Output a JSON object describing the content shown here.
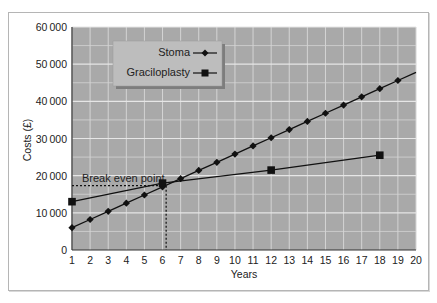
{
  "chart_data": {
    "type": "line",
    "title": "",
    "xlabel": "Years",
    "ylabel": "Costs (£)",
    "xlim": [
      1,
      20
    ],
    "ylim": [
      0,
      60000
    ],
    "x_ticks": [
      "1",
      "2",
      "3",
      "4",
      "5",
      "6",
      "7",
      "8",
      "9",
      "10",
      "11",
      "12",
      "13",
      "14",
      "15",
      "16",
      "17",
      "18",
      "19",
      "20"
    ],
    "y_ticks": [
      "0",
      "10000",
      "20000",
      "30000",
      "40000",
      "50000",
      "60000"
    ],
    "grid": true,
    "legend_position": "upper-left (inside plot)",
    "series": [
      {
        "name": "Stoma",
        "marker": "diamond",
        "x": [
          1,
          2,
          3,
          4,
          5,
          6,
          7,
          8,
          9,
          10,
          11,
          12,
          13,
          14,
          15,
          16,
          17,
          18,
          19,
          20
        ],
        "values": [
          6000,
          8200,
          10400,
          12600,
          14800,
          17000,
          19200,
          21400,
          23600,
          25800,
          28000,
          30200,
          32400,
          34600,
          36800,
          39000,
          41200,
          43400,
          45600,
          47800
        ],
        "marker_points": [
          1,
          2,
          3,
          4,
          5,
          6,
          7,
          8,
          9,
          10,
          11,
          12,
          13,
          14,
          15,
          16,
          17,
          18,
          19
        ]
      },
      {
        "name": "Graciloplasty",
        "marker": "square",
        "x": [
          1,
          6,
          12,
          18
        ],
        "values": [
          13000,
          18000,
          21500,
          25500
        ]
      }
    ],
    "annotations": [
      {
        "text": "Break even point",
        "x": 6.2,
        "y": 17300,
        "style": "dotted crosshair to axes"
      }
    ]
  },
  "legend": {
    "items": [
      {
        "label": "Stoma",
        "marker": "diamond"
      },
      {
        "label": "Graciloplasty",
        "marker": "square"
      }
    ]
  },
  "annotation_label": "Break even point",
  "colors": {
    "plot_bg": "#a9a9a9",
    "grid": "#d4d4d4",
    "line": "#111111",
    "legend_bg": "#bdbdbd",
    "legend_shadow": "#7d7d7d",
    "frame": "#b5b5b5"
  }
}
